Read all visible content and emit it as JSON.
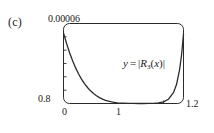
{
  "figure": {
    "panel_label": "(c)",
    "annotation_text": "y = |R3(x)|",
    "annotation_parts": {
      "lhs": "y",
      "equals": "=",
      "bar_open": "|",
      "func": "R",
      "subscript": "3",
      "arg_open": "(",
      "variable": "x",
      "arg_close": ")",
      "bar_close": "|"
    },
    "curve_color": "#2b2b2b",
    "frame_color": "#2b2b2b",
    "text_color": "#1a1a1a",
    "background_color": "#ffffff"
  },
  "chart_data": {
    "type": "line",
    "title": "(c)",
    "xlabel": "",
    "ylabel": "",
    "grid": false,
    "legend": null,
    "annotations": [
      {
        "text": "y = |R3(x)|",
        "x": 0.78,
        "y": 3.5e-05
      }
    ],
    "xlim": [
      0,
      1.2
    ],
    "ylim": [
      0.8,
      6e-05
    ],
    "xticks": [
      0,
      1,
      1.2
    ],
    "xtick_labels": [
      "0",
      "1",
      "1.2"
    ],
    "yticks": [
      0.8,
      6e-05
    ],
    "ytick_labels": [
      "0.8",
      "0.00006"
    ],
    "series": [
      {
        "name": "|R3(x)|",
        "x": [
          0.0,
          0.03,
          0.06,
          0.09,
          0.12,
          0.15,
          0.18,
          0.21,
          0.24,
          0.27,
          0.3,
          0.33,
          0.36,
          0.39,
          0.42,
          0.45,
          0.48,
          0.51,
          0.54,
          0.57,
          0.6,
          0.65,
          0.7,
          0.75,
          0.8,
          0.85,
          0.9,
          0.95,
          1.0,
          1.05,
          1.1,
          1.13,
          1.16,
          1.18,
          1.2
        ],
        "y": [
          5.3e-05,
          4.52e-05,
          3.83e-05,
          3.22e-05,
          2.69e-05,
          2.23e-05,
          1.83e-05,
          1.49e-05,
          1.2e-05,
          9.5e-06,
          7.5e-06,
          5.8e-06,
          4.4e-06,
          3.3e-06,
          2.4e-06,
          1.7e-06,
          1.2e-06,
          8e-07,
          5e-07,
          3e-07,
          2e-07,
          1e-07,
          3e-08,
          1e-08,
          5e-09,
          2e-08,
          1e-07,
          4e-07,
          1.2e-06,
          3.2e-06,
          8.2e-06,
          1.42e-05,
          2.5e-05,
          3.6e-05,
          5.2e-05
        ]
      }
    ]
  }
}
